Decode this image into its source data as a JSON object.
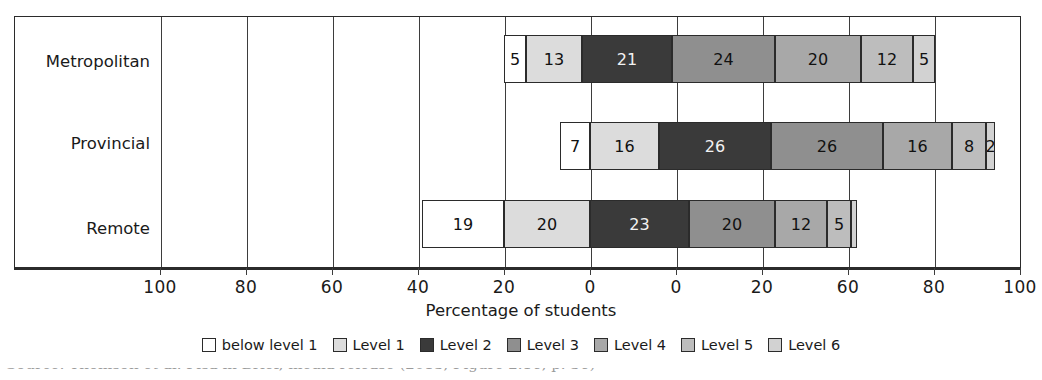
{
  "chart_data": {
    "type": "bar",
    "subtype": "diverging-stacked-bar",
    "orientation": "horizontal",
    "title": "",
    "xlabel": "Percentage of students",
    "ylabel": "",
    "categories": [
      "Metropolitan",
      "Provincial",
      "Remote"
    ],
    "series": [
      {
        "name": "below level 1",
        "color": "#ffffff",
        "values": [
          5,
          7,
          19
        ]
      },
      {
        "name": "Level 1",
        "color": "#dcdcdc",
        "values": [
          13,
          16,
          20
        ]
      },
      {
        "name": "Level 2",
        "color": "#3a3a3a",
        "values": [
          21,
          26,
          23
        ]
      },
      {
        "name": "Level 3",
        "color": "#8f8f8f",
        "values": [
          24,
          26,
          20
        ]
      },
      {
        "name": "Level 4",
        "color": "#a8a8a8",
        "values": [
          20,
          16,
          12
        ]
      },
      {
        "name": "Level 5",
        "color": "#bdbdbd",
        "values": [
          12,
          8,
          5
        ]
      },
      {
        "name": "Level 6",
        "color": "#d2d2d2",
        "values": [
          5,
          2,
          1
        ]
      }
    ],
    "tick_labels": [
      "100",
      "80",
      "60",
      "40",
      "20",
      "0",
      "0",
      "20",
      "60",
      "80",
      "100"
    ],
    "xlim": [
      -100,
      100
    ],
    "grid": true,
    "legend_position": "bottom",
    "legend_entries": [
      "below level 1",
      "Level 1",
      "Level 2",
      "Level 3",
      "Level 4",
      "Level 5",
      "Level 6"
    ]
  },
  "axis": {
    "title": "Percentage of students",
    "ticks": [
      {
        "label": "100",
        "x": 160
      },
      {
        "label": "80",
        "x": 246
      },
      {
        "label": "60",
        "x": 332
      },
      {
        "label": "40",
        "x": 418
      },
      {
        "label": "20",
        "x": 504
      },
      {
        "label": "0",
        "x": 590
      },
      {
        "label": "0",
        "x": 676
      },
      {
        "label": "20",
        "x": 762
      },
      {
        "label": "60",
        "x": 848
      },
      {
        "label": "80",
        "x": 934
      },
      {
        "label": "100",
        "x": 1020
      }
    ]
  },
  "rows": [
    {
      "label": "Metropolitan",
      "label_top": 52,
      "bar_top": 35,
      "segments": [
        {
          "value": "5",
          "left": 504,
          "width": 22,
          "color": "#ffffff",
          "dark": false
        },
        {
          "value": "13",
          "left": 526,
          "width": 56,
          "color": "#dcdcdc",
          "dark": false
        },
        {
          "value": "21",
          "left": 582,
          "width": 90,
          "color": "#3a3a3a",
          "dark": true
        },
        {
          "value": "24",
          "left": 672,
          "width": 103,
          "color": "#8f8f8f",
          "dark": false
        },
        {
          "value": "20",
          "left": 775,
          "width": 86,
          "color": "#a8a8a8",
          "dark": false
        },
        {
          "value": "12",
          "left": 861,
          "width": 52,
          "color": "#bdbdbd",
          "dark": false
        },
        {
          "value": "5",
          "left": 913,
          "width": 22,
          "color": "#d2d2d2",
          "dark": false
        }
      ]
    },
    {
      "label": "Provincial",
      "label_top": 134,
      "bar_top": 122,
      "segments": [
        {
          "value": "7",
          "left": 560,
          "width": 30,
          "color": "#ffffff",
          "dark": false
        },
        {
          "value": "16",
          "left": 590,
          "width": 69,
          "color": "#dcdcdc",
          "dark": false
        },
        {
          "value": "26",
          "left": 659,
          "width": 112,
          "color": "#3a3a3a",
          "dark": true
        },
        {
          "value": "26",
          "left": 771,
          "width": 112,
          "color": "#8f8f8f",
          "dark": false
        },
        {
          "value": "16",
          "left": 883,
          "width": 69,
          "color": "#a8a8a8",
          "dark": false
        },
        {
          "value": "8",
          "left": 952,
          "width": 34,
          "color": "#bdbdbd",
          "dark": false
        },
        {
          "value": "2",
          "left": 986,
          "width": 9,
          "color": "#d2d2d2",
          "dark": false
        }
      ]
    },
    {
      "label": "Remote",
      "label_top": 219,
      "bar_top": 200,
      "segments": [
        {
          "value": "19",
          "left": 422,
          "width": 82,
          "color": "#ffffff",
          "dark": false
        },
        {
          "value": "20",
          "left": 504,
          "width": 86,
          "color": "#dcdcdc",
          "dark": false
        },
        {
          "value": "23",
          "left": 590,
          "width": 99,
          "color": "#3a3a3a",
          "dark": true
        },
        {
          "value": "20",
          "left": 689,
          "width": 86,
          "color": "#8f8f8f",
          "dark": false
        },
        {
          "value": "12",
          "left": 775,
          "width": 52,
          "color": "#a8a8a8",
          "dark": false
        },
        {
          "value": "5",
          "left": 827,
          "width": 24,
          "color": "#bdbdbd",
          "dark": false
        },
        {
          "value": "",
          "left": 851,
          "width": 6,
          "color": "#d2d2d2",
          "dark": false
        }
      ]
    }
  ],
  "gridlines": [
    160,
    246,
    332,
    418,
    504,
    590,
    676,
    762,
    848,
    934
  ],
  "legend": [
    {
      "label": "below level 1",
      "color": "#ffffff"
    },
    {
      "label": "Level 1",
      "color": "#dcdcdc"
    },
    {
      "label": "Level 2",
      "color": "#3a3a3a"
    },
    {
      "label": "Level 3",
      "color": "#8f8f8f"
    },
    {
      "label": "Level 4",
      "color": "#a8a8a8"
    },
    {
      "label": "Level 5",
      "color": "#bdbdbd"
    },
    {
      "label": "Level 6",
      "color": "#d2d2d2"
    }
  ],
  "caption": {
    "text": "Source: Thomson et al. Pisa in Brief, media release (2013, Figure 2.16, p. 36)"
  }
}
